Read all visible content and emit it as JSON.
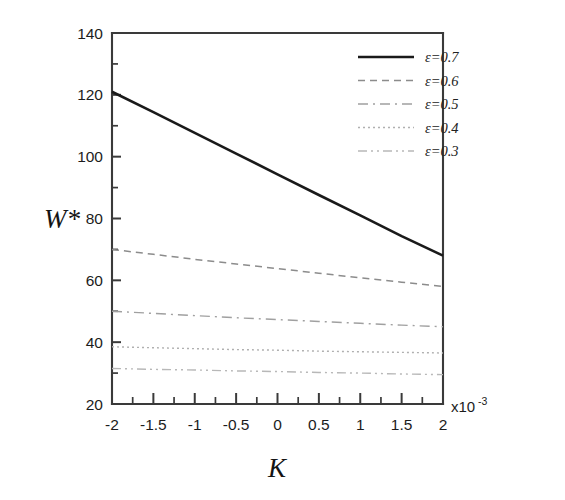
{
  "chart_data": {
    "type": "line",
    "title": "",
    "xlabel": "K",
    "ylabel": "W*",
    "xlim": [
      -2,
      2
    ],
    "ylim": [
      20,
      140
    ],
    "x_multiplier": "x10",
    "x_multiplier_exponent": "-3",
    "grid": false,
    "legend_position": "top-right inside",
    "x_major_ticks": [
      -2,
      -1.5,
      -1,
      -0.5,
      0,
      0.5,
      1,
      1.5,
      2
    ],
    "x_tick_labels": [
      "-2",
      "-1.5",
      "-1",
      "-0.5",
      "0",
      "0.5",
      "1",
      "1.5",
      "2"
    ],
    "x_minor_step": 0.25,
    "y_major_ticks": [
      20,
      40,
      60,
      80,
      100,
      120,
      140
    ],
    "y_tick_labels": [
      "20",
      "40",
      "60",
      "80",
      "100",
      "120",
      "140"
    ],
    "y_minor_step": 10,
    "x": [
      -2,
      -1.5,
      -1,
      -0.5,
      0,
      0.5,
      1,
      1.5,
      2
    ],
    "series": [
      {
        "name": "ε=0.7",
        "style": "solid",
        "color": "#1a1a1a",
        "width": 2.6,
        "dash": "",
        "values": [
          121.0,
          114.4,
          107.7,
          101.0,
          94.3,
          87.6,
          81.0,
          74.3,
          68.0
        ]
      },
      {
        "name": "ε=0.6",
        "style": "dashed",
        "color": "#8c8c8c",
        "width": 1.5,
        "dash": "7,5",
        "values": [
          70.0,
          68.4,
          66.8,
          65.3,
          63.8,
          62.3,
          60.8,
          59.4,
          58.0
        ]
      },
      {
        "name": "ε=0.5",
        "style": "dash-dot",
        "color": "#a0a0a0",
        "width": 1.4,
        "dash": "10,5,2,5",
        "values": [
          50.0,
          49.3,
          48.6,
          47.9,
          47.3,
          46.7,
          46.1,
          45.5,
          45.0
        ]
      },
      {
        "name": "ε=0.4",
        "style": "dotted",
        "color": "#b0b0b0",
        "width": 1.4,
        "dash": "2,3",
        "values": [
          38.5,
          38.2,
          37.9,
          37.6,
          37.4,
          37.1,
          36.9,
          36.7,
          36.5
        ]
      },
      {
        "name": "ε=0.3",
        "style": "dash-dot-dot",
        "color": "#b8b8b8",
        "width": 1.4,
        "dash": "9,4,2,4,2,4",
        "values": [
          31.5,
          31.2,
          31.0,
          30.7,
          30.5,
          30.2,
          30.0,
          29.7,
          29.5
        ]
      }
    ]
  },
  "legend": {
    "entries": [
      {
        "label": "ε=0.7"
      },
      {
        "label": "ε=0.6"
      },
      {
        "label": "ε=0.5"
      },
      {
        "label": "ε=0.4"
      },
      {
        "label": "ε=0.3"
      }
    ]
  }
}
